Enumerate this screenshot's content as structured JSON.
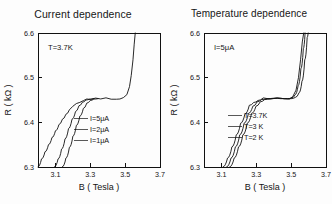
{
  "figure": {
    "background": "#fdfdfd",
    "ink_color": "#111111"
  },
  "panels": [
    {
      "id": "current-dependence",
      "title": "Current dependence",
      "annotation": "T=3.7K",
      "legend": [
        "I=5μA",
        "I=2μA",
        "I=1μA"
      ]
    },
    {
      "id": "temperature-dependence",
      "title": "Temperature dependence",
      "annotation": "I=5μA",
      "legend": [
        "T=3.7K",
        "T=3  K",
        "T=2  K"
      ]
    }
  ],
  "axes": {
    "x": {
      "label": "B ( Tesla )",
      "ticks": [
        "3.1",
        "3.3",
        "3.5",
        "3.7"
      ],
      "tick_values": [
        3.1,
        3.3,
        3.5,
        3.7
      ],
      "range": [
        3.0,
        3.7
      ]
    },
    "y": {
      "label": "R ( kΩ )",
      "ticks": [
        "6.3",
        "6.4",
        "6.5",
        "6.6"
      ],
      "tick_values": [
        6.3,
        6.4,
        6.5,
        6.6
      ],
      "range": [
        6.3,
        6.6
      ]
    }
  },
  "chart_data": {
    "type": "line",
    "xlabel": "B ( Tesla )",
    "ylabel": "R ( kΩ )",
    "xlim": [
      3.0,
      3.7
    ],
    "ylim": [
      6.3,
      6.6
    ],
    "grid": false,
    "legend_position": "inside-center-left",
    "panels": [
      {
        "title": "Current dependence",
        "annotation": "T=3.7K",
        "series": [
          {
            "name": "I=5μA",
            "noisy_plateau": true,
            "points": [
              [
                3.0,
                6.3
              ],
              [
                3.02,
                6.318
              ],
              [
                3.04,
                6.334
              ],
              [
                3.06,
                6.35
              ],
              [
                3.08,
                6.366
              ],
              [
                3.1,
                6.381
              ],
              [
                3.12,
                6.395
              ],
              [
                3.14,
                6.407
              ],
              [
                3.16,
                6.418
              ],
              [
                3.18,
                6.428
              ],
              [
                3.2,
                6.436
              ],
              [
                3.22,
                6.442
              ],
              [
                3.24,
                6.447
              ],
              [
                3.26,
                6.45
              ],
              [
                3.28,
                6.452
              ],
              [
                3.3,
                6.453
              ],
              [
                3.33,
                6.454
              ],
              [
                3.36,
                6.453
              ],
              [
                3.39,
                6.454
              ],
              [
                3.42,
                6.453
              ],
              [
                3.45,
                6.452
              ],
              [
                3.47,
                6.453
              ],
              [
                3.49,
                6.455
              ],
              [
                3.51,
                6.462
              ],
              [
                3.525,
                6.48
              ],
              [
                3.535,
                6.505
              ],
              [
                3.545,
                6.54
              ],
              [
                3.552,
                6.575
              ],
              [
                3.558,
                6.6
              ]
            ]
          },
          {
            "name": "I=2μA",
            "noisy_plateau": false,
            "points": [
              [
                3.095,
                6.3
              ],
              [
                3.115,
                6.318
              ],
              [
                3.135,
                6.34
              ],
              [
                3.155,
                6.363
              ],
              [
                3.175,
                6.386
              ],
              [
                3.195,
                6.407
              ],
              [
                3.215,
                6.424
              ],
              [
                3.235,
                6.437
              ],
              [
                3.255,
                6.445
              ],
              [
                3.275,
                6.45
              ],
              [
                3.295,
                6.452
              ],
              [
                3.32,
                6.453
              ]
            ]
          },
          {
            "name": "I=1μA",
            "noisy_plateau": false,
            "points": [
              [
                3.14,
                6.3
              ],
              [
                3.16,
                6.32
              ],
              [
                3.18,
                6.344
              ],
              [
                3.2,
                6.369
              ],
              [
                3.22,
                6.393
              ],
              [
                3.24,
                6.414
              ],
              [
                3.26,
                6.431
              ],
              [
                3.28,
                6.443
              ],
              [
                3.3,
                6.449
              ],
              [
                3.32,
                6.452
              ],
              [
                3.345,
                6.453
              ]
            ]
          }
        ]
      },
      {
        "title": "Temperature dependence",
        "annotation": "I=5μA",
        "series": [
          {
            "name": "T=3.7K",
            "noisy_plateau": true,
            "points": [
              [
                3.11,
                6.3
              ],
              [
                3.135,
                6.32
              ],
              [
                3.16,
                6.345
              ],
              [
                3.185,
                6.372
              ],
              [
                3.21,
                6.398
              ],
              [
                3.235,
                6.42
              ],
              [
                3.26,
                6.436
              ],
              [
                3.285,
                6.446
              ],
              [
                3.31,
                6.451
              ],
              [
                3.34,
                6.453
              ],
              [
                3.38,
                6.454
              ],
              [
                3.42,
                6.453
              ],
              [
                3.46,
                6.453
              ],
              [
                3.49,
                6.454
              ],
              [
                3.51,
                6.458
              ],
              [
                3.528,
                6.472
              ],
              [
                3.542,
                6.5
              ],
              [
                3.554,
                6.54
              ],
              [
                3.564,
                6.58
              ],
              [
                3.572,
                6.6
              ]
            ]
          },
          {
            "name": "T=3  K",
            "noisy_plateau": false,
            "points": [
              [
                3.13,
                6.3
              ],
              [
                3.155,
                6.32
              ],
              [
                3.18,
                6.345
              ],
              [
                3.205,
                6.372
              ],
              [
                3.23,
                6.398
              ],
              [
                3.255,
                6.42
              ],
              [
                3.28,
                6.436
              ],
              [
                3.305,
                6.446
              ],
              [
                3.33,
                6.451
              ],
              [
                3.36,
                6.453
              ],
              [
                3.4,
                6.454
              ],
              [
                3.44,
                6.453
              ],
              [
                3.48,
                6.453
              ],
              [
                3.505,
                6.455
              ],
              [
                3.523,
                6.462
              ],
              [
                3.54,
                6.482
              ],
              [
                3.556,
                6.52
              ],
              [
                3.57,
                6.565
              ],
              [
                3.58,
                6.6
              ]
            ]
          },
          {
            "name": "T=2  K",
            "noisy_plateau": false,
            "points": [
              [
                3.148,
                6.3
              ],
              [
                3.173,
                6.32
              ],
              [
                3.198,
                6.345
              ],
              [
                3.223,
                6.372
              ],
              [
                3.248,
                6.398
              ],
              [
                3.273,
                6.42
              ],
              [
                3.298,
                6.436
              ],
              [
                3.323,
                6.446
              ],
              [
                3.348,
                6.451
              ],
              [
                3.38,
                6.453
              ],
              [
                3.42,
                6.454
              ],
              [
                3.46,
                6.453
              ],
              [
                3.5,
                6.453
              ],
              [
                3.525,
                6.456
              ],
              [
                3.545,
                6.466
              ],
              [
                3.562,
                6.492
              ],
              [
                3.578,
                6.54
              ],
              [
                3.592,
                6.59
              ],
              [
                3.598,
                6.6
              ]
            ]
          }
        ]
      }
    ]
  }
}
